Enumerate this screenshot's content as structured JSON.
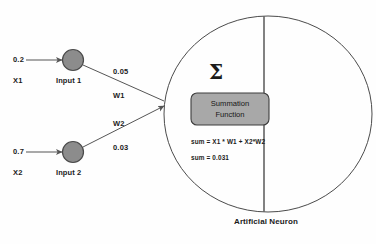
{
  "diagram": {
    "caption": "Artificial Neuron",
    "sigma_symbol": "Σ",
    "colors": {
      "node_fill": "#8c8c8c",
      "node_stroke": "#4a4a4a",
      "box_fill": "#a8a8a8",
      "box_stroke": "#3d3d3d",
      "line": "#555555",
      "circle_stroke": "#4b4b4b",
      "text": "#1b1b1b",
      "background": "#fefefe"
    },
    "inputs": [
      {
        "value": "0.2",
        "variable": "X1",
        "node_label": "Input 1"
      },
      {
        "value": "0.7",
        "variable": "X2",
        "node_label": "Input 2"
      }
    ],
    "weights": [
      {
        "value": "0.05",
        "name": "W1"
      },
      {
        "value": "0.03",
        "name": "W2"
      }
    ],
    "neuron": {
      "box_line1": "Summation",
      "box_line2": "Function",
      "formula": "sum = X1 * W1 + X2*W2",
      "result": "sum = 0.031"
    }
  }
}
